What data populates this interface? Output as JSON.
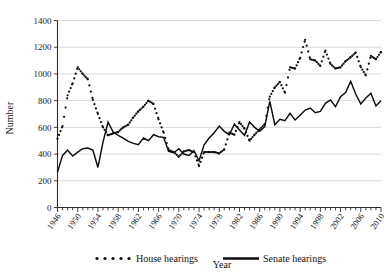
{
  "chart_data": {
    "type": "line",
    "title": "",
    "xlabel": "Year",
    "ylabel": "Number",
    "xlim": [
      1946,
      2010
    ],
    "ylim": [
      0,
      1400
    ],
    "ytick_step": 200,
    "yticks": [
      0,
      200,
      400,
      600,
      800,
      1000,
      1200,
      1400
    ],
    "xtick_step": 4,
    "xticks": [
      1946,
      1950,
      1954,
      1958,
      1962,
      1966,
      1970,
      1974,
      1978,
      1982,
      1986,
      1990,
      1994,
      1998,
      2002,
      2006,
      2010
    ],
    "grid": "horizontal",
    "legend_position": "bottom",
    "x": [
      1946,
      1947,
      1948,
      1949,
      1950,
      1951,
      1952,
      1953,
      1954,
      1955,
      1956,
      1957,
      1958,
      1959,
      1960,
      1961,
      1962,
      1963,
      1964,
      1965,
      1966,
      1967,
      1968,
      1969,
      1970,
      1971,
      1972,
      1973,
      1974,
      1975,
      1976,
      1977,
      1978,
      1979,
      1980,
      1981,
      1982,
      1983,
      1984,
      1985,
      1986,
      1987,
      1988,
      1989,
      1990,
      1991,
      1992,
      1993,
      1994,
      1995,
      1996,
      1997,
      1998,
      1999,
      2000,
      2001,
      2002,
      2003,
      2004,
      2005,
      2006,
      2007,
      2008,
      2009,
      2010
    ],
    "series": [
      {
        "name": "House hearings",
        "style": "dotted",
        "color": "#0d0d0d",
        "values": [
          515,
          610,
          840,
          930,
          1050,
          1000,
          960,
          805,
          700,
          600,
          540,
          555,
          565,
          600,
          620,
          675,
          720,
          755,
          800,
          775,
          660,
          560,
          430,
          415,
          380,
          420,
          430,
          415,
          310,
          415,
          415,
          415,
          405,
          435,
          560,
          545,
          640,
          590,
          500,
          545,
          585,
          625,
          830,
          900,
          940,
          860,
          1050,
          1040,
          1120,
          1255,
          1110,
          1100,
          1060,
          1175,
          1075,
          1040,
          1050,
          1095,
          1125,
          1160,
          1050,
          990,
          1135,
          1110,
          1165
        ],
        "values_note": "House series continues past index alignment; see house_values for full aligned list"
      },
      {
        "name": "Senate hearings",
        "style": "solid",
        "color": "#0d0d0d",
        "values": [
          265,
          390,
          430,
          385,
          415,
          440,
          445,
          430,
          300,
          490,
          640,
          565,
          540,
          520,
          495,
          480,
          470,
          520,
          500,
          545,
          530,
          525,
          420,
          410,
          440,
          400,
          390,
          425,
          350,
          470,
          520,
          560,
          610,
          570,
          545,
          625,
          580,
          540,
          640,
          600,
          570,
          605,
          795,
          620,
          660,
          650,
          705,
          655,
          690,
          730,
          745,
          710,
          720,
          780,
          805,
          755,
          830,
          860,
          945,
          850,
          775,
          820,
          855,
          760,
          800
        ],
        "values_note": "Senate series aligned to x array"
      }
    ],
    "house_values": [
      515,
      610,
      840,
      930,
      1050,
      1000,
      960,
      805,
      700,
      600,
      540,
      555,
      565,
      600,
      620,
      675,
      720,
      755,
      800,
      775,
      660,
      560,
      430,
      415,
      380,
      420,
      430,
      415,
      310,
      415,
      415,
      415,
      405,
      435,
      560,
      545,
      640,
      590,
      500,
      545,
      585,
      625,
      830,
      900,
      940,
      860,
      1050,
      1040,
      1120,
      1255,
      1110,
      1100,
      1060,
      1175,
      1075,
      1040,
      1050,
      1095,
      1125,
      1160,
      1050,
      990,
      1135,
      1110,
      1165
    ],
    "senate_values": [
      265,
      390,
      430,
      385,
      415,
      440,
      445,
      430,
      300,
      490,
      640,
      565,
      540,
      520,
      495,
      480,
      470,
      520,
      500,
      545,
      530,
      525,
      420,
      410,
      440,
      400,
      390,
      425,
      350,
      470,
      520,
      560,
      610,
      570,
      545,
      625,
      580,
      540,
      640,
      600,
      570,
      605,
      795,
      620,
      660,
      650,
      705,
      655,
      690,
      730,
      745,
      710,
      720,
      780,
      805,
      755,
      830,
      860,
      945,
      850,
      775,
      820,
      855,
      760,
      800
    ],
    "annotations": []
  },
  "legend": {
    "house_label": "House hearings",
    "senate_label": "Senate hearings"
  },
  "axes": {
    "y_title": "Number",
    "x_title": "Year"
  }
}
